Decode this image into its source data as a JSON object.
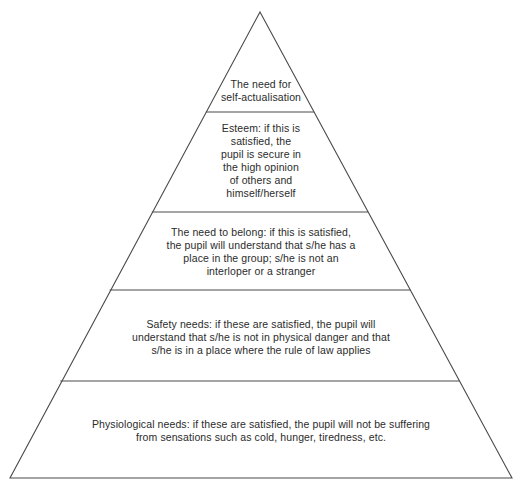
{
  "diagram": {
    "kind": "pyramid-diagram",
    "background_color": "#ffffff",
    "stroke_color": "#4a4a4a",
    "text_color": "#2b2b2b",
    "stroke_width": 1,
    "apex": {
      "x": 260,
      "y": 12
    },
    "base_left": {
      "x": 10,
      "y": 478
    },
    "base_right": {
      "x": 512,
      "y": 478
    },
    "divider_y_values": [
      112,
      212,
      290,
      381
    ],
    "tier_count": 5
  },
  "tiers": [
    {
      "id": "self-actualisation",
      "level": 5,
      "position": "apex",
      "text": "The need for\nself-actualisation",
      "lines": [
        "The need for",
        "self-actualisation"
      ]
    },
    {
      "id": "esteem",
      "level": 4,
      "position": "second-from-top",
      "text": "Esteem: if this is\nsatisfied, the\npupil is secure in\nthe high opinion\nof others and\nhimself/herself",
      "lines": [
        "Esteem: if this is",
        "satisfied, the",
        "pupil is secure in",
        "the high opinion",
        "of others and",
        "himself/herself"
      ]
    },
    {
      "id": "belonging",
      "level": 3,
      "position": "middle",
      "text": "The need to belong: if this is satisfied,\nthe pupil will understand that s/he has a\nplace in the group; s/he is not an\ninterloper or a stranger",
      "lines": [
        "The need to belong: if this is satisfied,",
        "the pupil will understand that s/he has a",
        "place in the group; s/he is not an",
        "interloper or a stranger"
      ]
    },
    {
      "id": "safety",
      "level": 2,
      "position": "second-from-bottom",
      "text": "Safety needs: if these are satisfied, the pupil will\nunderstand that s/he is not in physical danger and that\ns/he is in a place where the rule of law applies",
      "lines": [
        "Safety needs: if these are satisfied, the pupil will",
        "understand that s/he is not in physical danger and that",
        "s/he is in a place where the rule of law applies"
      ]
    },
    {
      "id": "physiological",
      "level": 1,
      "position": "base",
      "text": "Physiological needs:  if these are satisfied, the pupil will not be suffering\nfrom sensations such as cold, hunger, tiredness, etc.",
      "lines": [
        "Physiological needs:  if these are satisfied, the pupil will not be suffering",
        "from sensations such as cold, hunger, tiredness, etc."
      ]
    }
  ]
}
